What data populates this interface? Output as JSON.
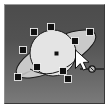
{
  "app": {
    "title": "Vector Shape Editor Canvas",
    "canvas_background_top": "#4c4c4c",
    "canvas_background_bottom": "#7a7a7a"
  },
  "canvas": {
    "name": "drawing-canvas",
    "x": 4,
    "y": 4,
    "width": 101,
    "height": 100
  },
  "shapes": [
    {
      "id": "ring-ellipse",
      "type": "ellipse",
      "label": "Rotated ring ellipse",
      "cx": 56,
      "cy": 54,
      "rx": 44,
      "ry": 15,
      "rotation_deg": -27,
      "fill": "#c9c9c9",
      "stroke": "#1a1a1a",
      "stroke_width": 1
    },
    {
      "id": "body-circle",
      "type": "circle",
      "label": "Planet body circle",
      "cx": 53,
      "cy": 53,
      "r": 23,
      "fill": "#e4e4e4",
      "stroke": "#1a1a1a",
      "stroke_width": 1
    }
  ],
  "selection": {
    "label": "Selection handles",
    "handle_size": 7,
    "handle_fill": "#101010",
    "handle_stroke": "#ffffff",
    "center_marker": {
      "cx": 56.5,
      "cy": 53.5,
      "size": 4,
      "fill": "#101010"
    },
    "handles": [
      {
        "name": "handle-top-left",
        "cx": 34,
        "cy": 32
      },
      {
        "name": "handle-top-center",
        "cx": 51,
        "cy": 27
      },
      {
        "name": "handle-top-right",
        "cx": 90,
        "cy": 32
      },
      {
        "name": "handle-mid-left",
        "cx": 23,
        "cy": 50
      },
      {
        "name": "handle-mid-right",
        "cx": 75,
        "cy": 41
      },
      {
        "name": "handle-bottom-left",
        "cx": 18,
        "cy": 77
      },
      {
        "name": "handle-bottom-center",
        "cx": 37,
        "cy": 67
      },
      {
        "name": "handle-bottom-right",
        "cx": 63,
        "cy": 71
      },
      {
        "name": "handle-bottom-far",
        "cx": 68,
        "cy": 79
      }
    ]
  },
  "cursor": {
    "name": "arrow-pointer-cursor",
    "x": 75,
    "y": 50,
    "width": 14,
    "height": 19,
    "fill": "#ffffff",
    "stroke": "#101010"
  },
  "control_node": {
    "name": "rotation-control-node",
    "cx": 92,
    "cy": 69,
    "r": 3.2,
    "fill": "#bdbdbd",
    "stroke": "#101010",
    "line_from_x": 80,
    "line_to_x": 110,
    "line_y": 69
  }
}
